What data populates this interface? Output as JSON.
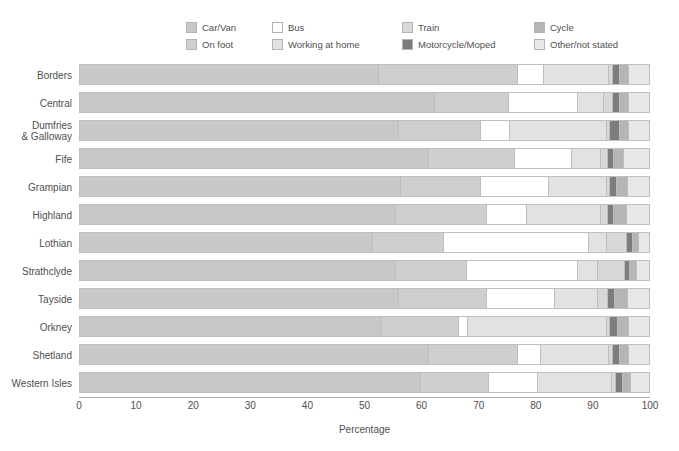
{
  "chart_data": {
    "type": "bar",
    "orientation": "horizontal",
    "stacked": true,
    "stack_total": 100,
    "title": "",
    "xlabel": "Percentage",
    "ylabel": "",
    "xlim": [
      0,
      100
    ],
    "xticks": [
      0,
      10,
      20,
      30,
      40,
      50,
      60,
      70,
      80,
      90,
      100
    ],
    "grid": false,
    "legend_position": "top",
    "categories": [
      "Borders",
      "Central",
      "Dumfries & Galloway",
      "Fife",
      "Grampian",
      "Highland",
      "Lothian",
      "Strathclyde",
      "Tayside",
      "Orkney",
      "Shetland",
      "Western Isles"
    ],
    "series": [
      {
        "name": "Car/Van",
        "color": "#c8c8c8",
        "values": [
          53.0,
          63.0,
          56.5,
          62.0,
          57.0,
          56.0,
          52.0,
          56.0,
          56.5,
          53.5,
          62.0,
          60.5
        ]
      },
      {
        "name": "On foot",
        "color": "#cfcfcf",
        "values": [
          24.5,
          13.0,
          14.5,
          15.0,
          14.0,
          16.0,
          12.5,
          12.5,
          15.5,
          13.5,
          15.5,
          12.0
        ]
      },
      {
        "name": "Bus",
        "color": "#ffffff",
        "values": [
          4.5,
          12.0,
          5.0,
          10.0,
          12.0,
          7.0,
          25.5,
          19.5,
          12.0,
          1.5,
          4.0,
          8.5
        ]
      },
      {
        "name": "Working at home",
        "color": "#e2e2e2",
        "values": [
          11.5,
          4.5,
          17.0,
          5.0,
          10.0,
          13.0,
          3.0,
          3.5,
          7.5,
          24.5,
          12.0,
          13.0
        ]
      },
      {
        "name": "Train",
        "color": "#d8d8d8",
        "values": [
          0.5,
          1.5,
          0.5,
          1.0,
          0.5,
          1.0,
          3.5,
          4.5,
          1.5,
          0.5,
          0.5,
          0.5
        ]
      },
      {
        "name": "Motorcycle/Moped",
        "color": "#7d7d7d",
        "values": [
          1.0,
          1.0,
          1.5,
          1.0,
          1.0,
          1.0,
          0.8,
          0.8,
          1.2,
          1.2,
          1.0,
          1.0
        ]
      },
      {
        "name": "Cycle",
        "color": "#b5b5b5",
        "values": [
          1.5,
          1.5,
          1.5,
          1.5,
          1.8,
          2.0,
          0.9,
          1.0,
          2.0,
          1.8,
          1.5,
          1.3
        ]
      },
      {
        "name": "Other/not stated",
        "color": "#e8e8e8",
        "values": [
          3.5,
          3.5,
          3.5,
          4.5,
          3.7,
          4.0,
          1.8,
          2.2,
          3.8,
          3.5,
          3.5,
          3.2
        ]
      }
    ]
  },
  "legend": {
    "items": [
      {
        "label": "Car/Van",
        "color": "#c8c8c8"
      },
      {
        "label": "Bus",
        "color": "#ffffff"
      },
      {
        "label": "Train",
        "color": "#d8d8d8"
      },
      {
        "label": "Cycle",
        "color": "#b5b5b5"
      },
      {
        "label": "On foot",
        "color": "#cfcfcf"
      },
      {
        "label": "Working at home",
        "color": "#e2e2e2"
      },
      {
        "label": "Motorcycle/Moped",
        "color": "#7d7d7d"
      },
      {
        "label": "Other/not stated",
        "color": "#e8e8e8"
      }
    ]
  },
  "axis": {
    "x_title": "Percentage",
    "x_tick_labels": [
      "0",
      "10",
      "20",
      "30",
      "40",
      "50",
      "60",
      "70",
      "80",
      "90",
      "100"
    ]
  },
  "y_category_labels": [
    [
      "Borders"
    ],
    [
      "Central"
    ],
    [
      "Dumfries",
      "& Galloway"
    ],
    [
      "Fife"
    ],
    [
      "Grampian"
    ],
    [
      "Highland"
    ],
    [
      "Lothian"
    ],
    [
      "Strathclyde"
    ],
    [
      "Tayside"
    ],
    [
      "Orkney"
    ],
    [
      "Shetland"
    ],
    [
      "Western Isles"
    ]
  ]
}
